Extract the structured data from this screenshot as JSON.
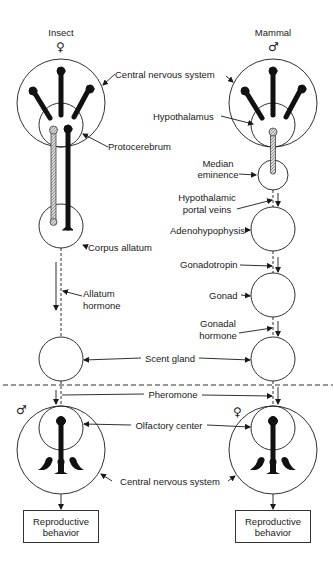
{
  "diagram": {
    "columns": {
      "left": {
        "title": "Insect",
        "sex_symbol": "♀"
      },
      "right": {
        "title": "Mammal",
        "sex_symbol": "♂"
      }
    },
    "labels": {
      "central_nervous_system_top": "Central nervous system",
      "hypothalamus": "Hypothalamus",
      "protocerebrum": "Protocerebrum",
      "median_eminence_1": "Median",
      "median_eminence_2": "eminence",
      "hypothalamic_portal_veins_1": "Hypothalamic",
      "hypothalamic_portal_veins_2": "portal veins",
      "adenohypophysis": "Adenohypophysis",
      "corpus_allatum": "Corpus allatum",
      "gonadotropin": "Gonadotropin",
      "allatum_hormone_1": "Allatum",
      "allatum_hormone_2": "hormone",
      "gonad": "Gonad",
      "gonadal_hormone_1": "Gonadal",
      "gonadal_hormone_2": "hormone",
      "scent_gland": "Scent gland",
      "pheromone": "Pheromone",
      "olfactory_center": "Olfactory center",
      "central_nervous_system_bottom": "Central nervous system"
    },
    "receivers": {
      "left_sex_symbol": "♂",
      "right_sex_symbol": "♀"
    },
    "outputs": {
      "left": {
        "line1": "Reproductive",
        "line2": "behavior"
      },
      "right": {
        "line1": "Reproductive",
        "line2": "behavior"
      }
    }
  }
}
